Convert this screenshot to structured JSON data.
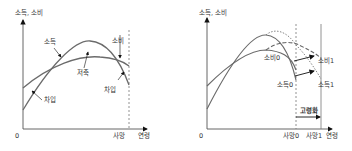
{
  "colors": {
    "axis": "#555555",
    "curve": "#6b6b6b",
    "dashed": "#777777",
    "arrow": "#111111",
    "text": "#333333"
  },
  "left_panel": {
    "y_axis_label": "소득, 소비",
    "x_axis_label": "연령",
    "origin_label": "0",
    "death_label": "사망",
    "curves": {
      "income_label": "소득",
      "consumption_label": "소비"
    },
    "annotations": {
      "saving_label": "저축",
      "borrow_early_label": "차입",
      "borrow_late_label": "차입"
    }
  },
  "right_panel": {
    "y_axis_label": "소득, 소비",
    "x_axis_label": "연령",
    "origin_label": "0",
    "death0_label": "사망0",
    "death1_label": "사망1",
    "curves": {
      "consumption0_label": "소비0",
      "consumption1_label": "소비1",
      "income0_label": "소득0",
      "income1_label": "소득1"
    },
    "aging_label": "고령화"
  }
}
